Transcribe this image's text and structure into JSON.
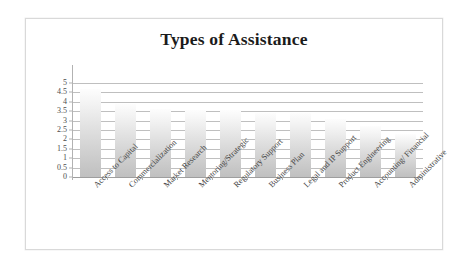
{
  "chart_data": {
    "type": "bar",
    "title": "Types of Assistance",
    "xlabel": "",
    "ylabel": "",
    "ylim": [
      0,
      5
    ],
    "y_ticks": [
      "5",
      "4.5",
      "4",
      "3.5",
      "3",
      "2.5",
      "2",
      "1.5",
      "1",
      "0.5",
      "0"
    ],
    "y_tick_values": [
      5,
      4.5,
      4,
      3.5,
      3,
      2.5,
      2,
      1.5,
      1,
      0.5,
      0
    ],
    "grid": true,
    "legend": "none",
    "categories": [
      "Access to Capital",
      "Commercialization",
      "Market Research",
      "Mentoring/Strategic",
      "Regulatory Support",
      "Business Plan",
      "Legal and IP Support",
      "Product Engineering",
      "Accounting/ Financial",
      "Administrative"
    ],
    "values": [
      4.7,
      3.9,
      3.6,
      3.55,
      3.55,
      3.4,
      3.4,
      3.1,
      2.7,
      2.3
    ],
    "bar_gradient_top": "#fdfdfd",
    "bar_gradient_bottom": "#c0c0c0",
    "gridline_color": "#bfbfbf",
    "axis_color": "#9e9e9e",
    "title_color": "#1b1b1b",
    "frame_color": "#d9d9d9",
    "background": "#ffffff"
  }
}
